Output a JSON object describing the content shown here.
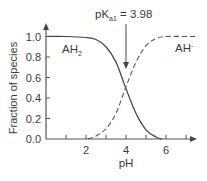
{
  "chart_data": {
    "type": "line",
    "title": "",
    "xlabel": "pH",
    "ylabel": "Fraction of species",
    "xlim": [
      0,
      7.5
    ],
    "ylim": [
      0,
      1.0
    ],
    "x_ticks": [
      1,
      2,
      3,
      4,
      5,
      6,
      7
    ],
    "x_tick_labels": [
      "2",
      "4",
      "6"
    ],
    "y_ticks": [
      0.0,
      0.2,
      0.4,
      0.6,
      0.8,
      1.0
    ],
    "y_tick_labels": [
      "0.0",
      "0.2",
      "0.4",
      "0.6",
      "0.8",
      "1.0"
    ],
    "grid": false,
    "pKa": 3.98,
    "series": [
      {
        "name": "AH2",
        "style": "solid",
        "x": [
          0,
          1,
          2,
          2.5,
          3,
          3.5,
          3.98,
          4.5,
          5,
          5.5,
          5.8
        ],
        "values": [
          1.0,
          1.0,
          0.99,
          0.97,
          0.9,
          0.75,
          0.5,
          0.25,
          0.09,
          0.02,
          0.0
        ]
      },
      {
        "name": "AH-",
        "style": "dashed",
        "x": [
          2.1,
          2.5,
          3,
          3.5,
          3.98,
          4.5,
          5,
          5.5,
          6,
          7,
          7.5
        ],
        "values": [
          0.0,
          0.03,
          0.1,
          0.25,
          0.5,
          0.75,
          0.91,
          0.98,
          1.0,
          1.0,
          1.0
        ]
      }
    ],
    "annotations": [
      {
        "text": "pKa1 = 3.98",
        "main": "pK",
        "sub": "a1",
        "rest": " = 3.98",
        "arrow_to_x": 3.98
      }
    ],
    "legend": "inline labels"
  },
  "labels": {
    "ah2_main": "AH",
    "ah2_sub": "2",
    "ahm_main": "AH",
    "ahm_sup": "-",
    "pka_main": "pK",
    "pka_sub": "a1",
    "pka_rest": " = 3.98",
    "xlabel": "pH",
    "ylabel": "Fraction of species"
  }
}
